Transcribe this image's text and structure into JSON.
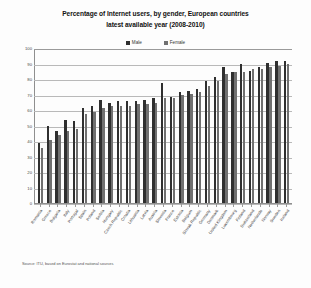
{
  "chart_data": {
    "type": "bar",
    "title": "Percentage of Internet users, by gender, European countries",
    "subtitle": "latest available year (2008-2010)",
    "xlabel": "",
    "ylabel": "",
    "ylim": [
      0,
      100
    ],
    "ytick_step": 10,
    "yticks": [
      100,
      90,
      80,
      70,
      60,
      50,
      40,
      30,
      20,
      10,
      0
    ],
    "grid": true,
    "legend_position": "top-center",
    "source": "Source: ITU, based on Eurostat and national sources",
    "categories": [
      "Romania",
      "Greece",
      "Bulgaria",
      "Italy",
      "Portugal",
      "Spain",
      "Poland",
      "Serbia",
      "Hungary",
      "Czech Republic",
      "Croatia",
      "Lithuania",
      "Latvia",
      "Austria",
      "Slovenia",
      "France",
      "Estonia",
      "Belgium",
      "Slovak Republic",
      "Germany",
      "Denmark",
      "United Kingdom",
      "Luxembourg",
      "Finland",
      "Switzerland",
      "Netherlands",
      "Norway",
      "Sweden",
      "Iceland"
    ],
    "series": [
      {
        "name": "Male",
        "color": "#2f2f2f",
        "values": [
          39,
          50,
          47,
          54,
          53,
          62,
          63,
          67,
          65,
          66,
          66,
          66,
          67,
          68,
          78,
          69,
          72,
          73,
          74,
          79,
          82,
          88,
          85,
          90,
          86,
          88,
          91,
          92,
          92
        ]
      },
      {
        "name": "Female",
        "color": "#707070",
        "values": [
          36,
          41,
          44,
          47,
          48,
          58,
          59,
          62,
          63,
          63,
          63,
          64,
          64,
          65,
          68,
          68,
          70,
          71,
          72,
          76,
          79,
          84,
          85,
          85,
          87,
          87,
          88,
          89,
          90
        ]
      }
    ]
  },
  "legend": {
    "items": [
      {
        "label": "Male",
        "color": "#2f2f2f"
      },
      {
        "label": "Female",
        "color": "#707070"
      }
    ]
  }
}
